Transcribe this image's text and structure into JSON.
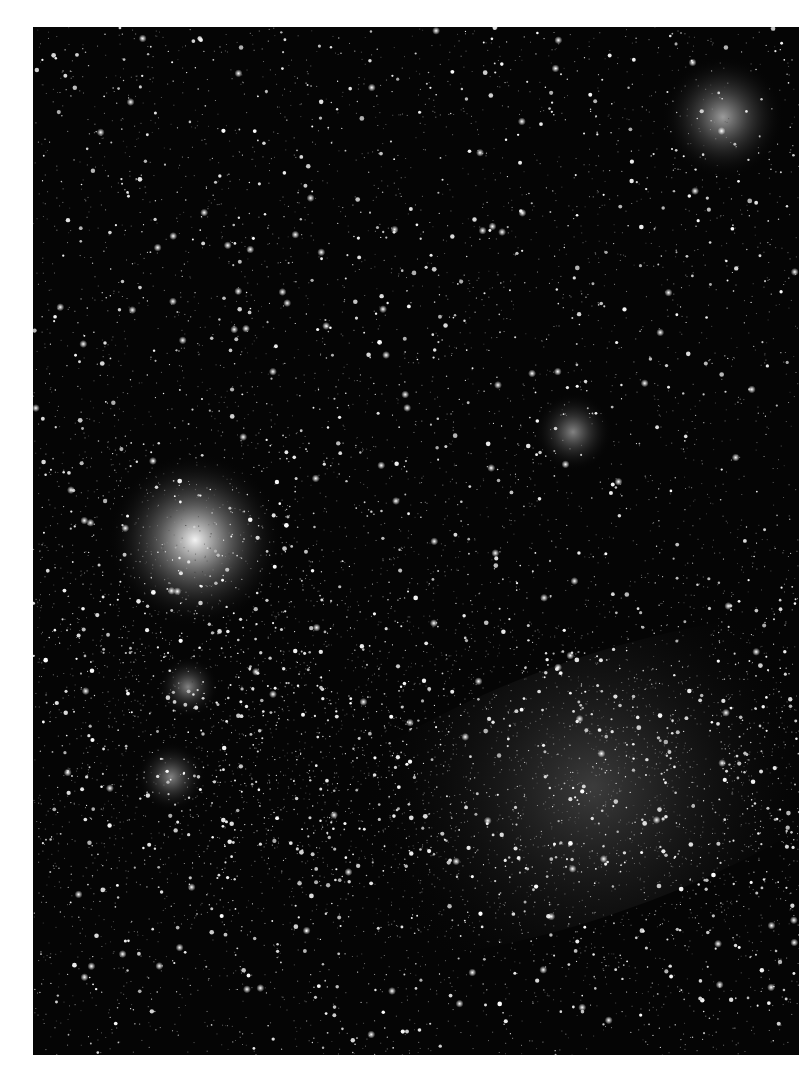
{
  "image": {
    "subject": "Large Magellanic Cloud star field with Tarantula Nebula",
    "alt": "Black-and-white astrophotograph of a dense star field with a bright nebula at left center and a diffuse glowing bar of stars toward the lower right",
    "background_color": "#050505",
    "frame_color": "#ffffff"
  },
  "features": [
    {
      "name": "tarantula-nebula",
      "x": 162,
      "y": 513,
      "r": 40,
      "intensity": 0.95
    },
    {
      "name": "nebula-knot-upper-right",
      "x": 690,
      "y": 90,
      "r": 28,
      "intensity": 0.6
    },
    {
      "name": "cluster-center-right",
      "x": 540,
      "y": 405,
      "r": 18,
      "intensity": 0.5
    },
    {
      "name": "nebula-knot-left",
      "x": 155,
      "y": 660,
      "r": 14,
      "intensity": 0.5
    },
    {
      "name": "nebula-knot-lower-left",
      "x": 138,
      "y": 750,
      "r": 16,
      "intensity": 0.5
    },
    {
      "name": "bar-glow",
      "x": 560,
      "y": 760,
      "r": 230,
      "intensity": 0.22
    }
  ]
}
